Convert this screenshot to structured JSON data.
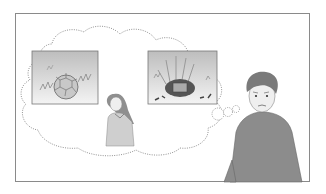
{
  "illustration": {
    "description": "Cartoon scene: a sad boy on the right imagines (thought cloud) a girl standing between two pictures — a football in grass, and the same football smashed/destroyed in grass.",
    "frame_color": "#8a8a8a",
    "panels": [
      {
        "name": "ball-intact-picture",
        "subject": "football in grass"
      },
      {
        "name": "ball-destroyed-picture",
        "subject": "broken football with debris in grass"
      }
    ],
    "characters": [
      {
        "name": "girl",
        "pose": "looking down"
      },
      {
        "name": "boy",
        "expression": "sad",
        "shirt_color": "#8c8c8c"
      }
    ],
    "colors": {
      "panel_bg_top": "#bdbdbd",
      "panel_bg_bottom": "#f2f2f2",
      "cloud_outline": "#777777",
      "shirt": "#8c8c8c",
      "hair": "#7a7a7a",
      "skin": "#ededed"
    }
  }
}
